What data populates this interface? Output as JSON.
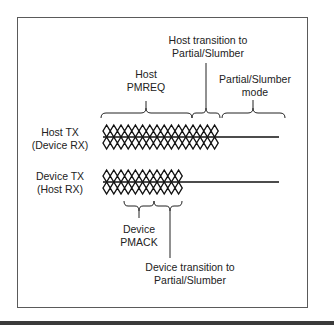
{
  "diagram": {
    "signals": [
      {
        "name": "Host TX",
        "sub": "(Device RX)"
      },
      {
        "name": "Device TX",
        "sub": "(Host RX)"
      }
    ],
    "top_annotations": {
      "host_pmreq": {
        "line1": "Host",
        "line2": "PMREQ"
      },
      "host_transition": {
        "line1": "Host transition to",
        "line2": "Partial/Slumber"
      },
      "partial_slumber_mode": {
        "line1": "Partial/Slumber",
        "line2": "mode"
      }
    },
    "bottom_annotations": {
      "device_pmack": {
        "line1": "Device",
        "line2": "PMACK"
      },
      "device_transition": {
        "line1": "Device transition to",
        "line2": "Partial/Slumber"
      }
    },
    "colors": {
      "stroke": "#111111",
      "text": "#222222",
      "frame": "#5a5a5a"
    }
  }
}
